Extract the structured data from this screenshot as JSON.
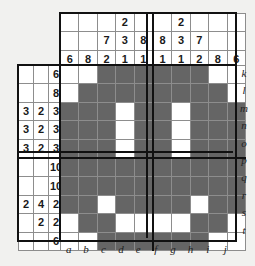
{
  "puzzle": {
    "title": "nonogram-grid",
    "type": "nonogram",
    "width": 10,
    "height": 10,
    "block_size": 5,
    "colors": {
      "filled": "#656565",
      "empty": "#ffffff",
      "grid_line": "#8d8d8d",
      "heavy_line": "#111111",
      "page_background": "#f1f1ef",
      "clue_text": "#1a1a1a"
    },
    "column_labels": [
      "a",
      "b",
      "c",
      "d",
      "e",
      "f",
      "g",
      "h",
      "i",
      "j"
    ],
    "row_labels": [
      "k",
      "l",
      "m",
      "n",
      "o",
      "p",
      "q",
      "r",
      "s",
      "t"
    ],
    "column_clues": [
      [
        "",
        "",
        "6"
      ],
      [
        "",
        "",
        "8"
      ],
      [
        "",
        "7",
        "2"
      ],
      [
        "2",
        "3",
        "1"
      ],
      [
        "",
        "8",
        "1"
      ],
      [
        "",
        "8",
        "1"
      ],
      [
        "2",
        "3",
        "1"
      ],
      [
        "",
        "7",
        "2"
      ],
      [
        "",
        "",
        "8"
      ],
      [
        "",
        "",
        "6"
      ]
    ],
    "row_clues": [
      [
        "",
        "",
        "6"
      ],
      [
        "",
        "",
        "8"
      ],
      [
        "3",
        "2",
        "3"
      ],
      [
        "3",
        "2",
        "3"
      ],
      [
        "3",
        "2",
        "3"
      ],
      [
        "",
        "",
        "10"
      ],
      [
        "",
        "",
        "10"
      ],
      [
        "2",
        "4",
        "2"
      ],
      [
        "",
        "2",
        "2"
      ],
      [
        "",
        "",
        "6"
      ]
    ],
    "grid": [
      [
        0,
        0,
        1,
        1,
        1,
        1,
        1,
        1,
        0,
        0
      ],
      [
        0,
        1,
        1,
        1,
        1,
        1,
        1,
        1,
        1,
        0
      ],
      [
        1,
        1,
        1,
        0,
        1,
        1,
        0,
        1,
        1,
        1
      ],
      [
        1,
        1,
        1,
        0,
        1,
        1,
        0,
        1,
        1,
        1
      ],
      [
        1,
        1,
        1,
        0,
        1,
        1,
        0,
        1,
        1,
        1
      ],
      [
        1,
        1,
        1,
        1,
        1,
        1,
        1,
        1,
        1,
        1
      ],
      [
        1,
        1,
        1,
        1,
        1,
        1,
        1,
        1,
        1,
        1
      ],
      [
        1,
        1,
        0,
        1,
        1,
        1,
        1,
        0,
        1,
        1
      ],
      [
        0,
        1,
        1,
        0,
        0,
        0,
        0,
        1,
        1,
        0
      ],
      [
        0,
        0,
        1,
        1,
        1,
        1,
        1,
        1,
        0,
        0
      ]
    ]
  }
}
